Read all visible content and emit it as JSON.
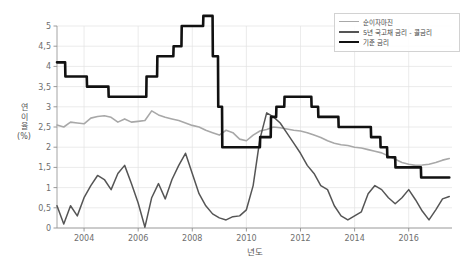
{
  "chart_data": {
    "type": "line",
    "title": "",
    "xlabel": "년도",
    "ylabel": "연이율 (%)",
    "ylabel_chars": [
      "연",
      "이",
      "율",
      "(%)"
    ],
    "xlim": [
      2003.0,
      2017.6
    ],
    "ylim": [
      0,
      5
    ],
    "grid": true,
    "legend_position": "top-right",
    "ytick_labels": [
      "0",
      "0,5",
      "1",
      "1,5",
      "2",
      "2,5",
      "3",
      "3,5",
      "4",
      "4,5",
      "5"
    ],
    "ytick_values": [
      0,
      0.5,
      1,
      1.5,
      2,
      2.5,
      3,
      3.5,
      4,
      4.5,
      5
    ],
    "xtick_labels": [
      "2004",
      "2006",
      "2008",
      "2010",
      "2012",
      "2014",
      "2016"
    ],
    "xtick_values": [
      2004,
      2006,
      2008,
      2010,
      2012,
      2014,
      2016
    ],
    "colors": {
      "nim": "#a8a8a8",
      "spread": "#555555",
      "base_rate": "#111111",
      "grid": "#e3e3e3",
      "axis": "#9a9a9a"
    },
    "series": [
      {
        "name": "순이자마진",
        "key": "nim",
        "color": "#a8a8a8",
        "width": 1.6,
        "x": [
          2003.0,
          2003.25,
          2003.5,
          2003.75,
          2004.0,
          2004.25,
          2004.5,
          2004.75,
          2005.0,
          2005.25,
          2005.5,
          2005.75,
          2006.0,
          2006.25,
          2006.5,
          2006.75,
          2007.0,
          2007.25,
          2007.5,
          2007.75,
          2008.0,
          2008.25,
          2008.5,
          2008.75,
          2009.0,
          2009.25,
          2009.5,
          2009.75,
          2010.0,
          2010.25,
          2010.5,
          2010.75,
          2011.0,
          2011.25,
          2011.5,
          2011.75,
          2012.0,
          2012.25,
          2012.5,
          2012.75,
          2013.0,
          2013.25,
          2013.5,
          2013.75,
          2014.0,
          2014.25,
          2014.5,
          2014.75,
          2015.0,
          2015.25,
          2015.5,
          2015.75,
          2016.0,
          2016.25,
          2016.5,
          2016.75,
          2017.0,
          2017.25,
          2017.5
        ],
        "values": [
          2.55,
          2.5,
          2.62,
          2.6,
          2.58,
          2.72,
          2.76,
          2.78,
          2.74,
          2.62,
          2.7,
          2.62,
          2.64,
          2.66,
          2.9,
          2.8,
          2.74,
          2.7,
          2.66,
          2.6,
          2.54,
          2.5,
          2.42,
          2.36,
          2.3,
          2.42,
          2.36,
          2.2,
          2.16,
          2.3,
          2.4,
          2.44,
          2.5,
          2.48,
          2.45,
          2.42,
          2.4,
          2.36,
          2.3,
          2.24,
          2.16,
          2.1,
          2.06,
          2.04,
          2.0,
          1.98,
          1.94,
          1.9,
          1.86,
          1.78,
          1.7,
          1.62,
          1.58,
          1.55,
          1.56,
          1.58,
          1.62,
          1.68,
          1.72
        ]
      },
      {
        "name": "5년 국고채 금리 - 콜금리",
        "key": "spread",
        "color": "#555555",
        "width": 1.5,
        "x": [
          2003.0,
          2003.25,
          2003.5,
          2003.75,
          2004.0,
          2004.25,
          2004.5,
          2004.75,
          2005.0,
          2005.25,
          2005.5,
          2005.75,
          2006.0,
          2006.25,
          2006.5,
          2006.75,
          2007.0,
          2007.25,
          2007.5,
          2007.75,
          2008.0,
          2008.25,
          2008.5,
          2008.75,
          2009.0,
          2009.25,
          2009.5,
          2009.75,
          2010.0,
          2010.25,
          2010.5,
          2010.75,
          2011.0,
          2011.25,
          2011.5,
          2011.75,
          2012.0,
          2012.25,
          2012.5,
          2012.75,
          2013.0,
          2013.25,
          2013.5,
          2013.75,
          2014.0,
          2014.25,
          2014.5,
          2014.75,
          2015.0,
          2015.25,
          2015.5,
          2015.75,
          2016.0,
          2016.25,
          2016.5,
          2016.75,
          2017.0,
          2017.25,
          2017.5
        ],
        "values": [
          0.55,
          0.1,
          0.55,
          0.3,
          0.75,
          1.05,
          1.3,
          1.2,
          0.95,
          1.35,
          1.55,
          1.1,
          0.62,
          0.02,
          0.75,
          1.1,
          0.72,
          1.2,
          1.55,
          1.85,
          1.35,
          0.85,
          0.55,
          0.35,
          0.25,
          0.2,
          0.28,
          0.3,
          0.45,
          1.05,
          2.2,
          2.85,
          2.75,
          2.6,
          2.35,
          2.1,
          1.85,
          1.55,
          1.35,
          1.05,
          0.95,
          0.55,
          0.3,
          0.2,
          0.3,
          0.4,
          0.85,
          1.05,
          0.95,
          0.75,
          0.6,
          0.75,
          0.95,
          0.7,
          0.42,
          0.2,
          0.45,
          0.72,
          0.78
        ]
      },
      {
        "name": "기준 금리",
        "key": "base_rate",
        "color": "#111111",
        "width": 2.6,
        "x": [
          2003.0,
          2003.3,
          2003.31,
          2004.1,
          2004.11,
          2004.9,
          2004.91,
          2005.9,
          2005.91,
          2006.3,
          2006.31,
          2006.7,
          2006.71,
          2007.3,
          2007.31,
          2007.6,
          2007.61,
          2008.4,
          2008.41,
          2008.75,
          2008.76,
          2008.95,
          2008.96,
          2009.1,
          2009.11,
          2010.5,
          2010.51,
          2010.9,
          2010.91,
          2011.1,
          2011.11,
          2011.4,
          2011.41,
          2012.4,
          2012.41,
          2012.65,
          2012.66,
          2013.4,
          2013.41,
          2014.6,
          2014.61,
          2014.95,
          2014.96,
          2015.2,
          2015.21,
          2015.5,
          2015.51,
          2016.45,
          2016.46,
          2017.5
        ],
        "values": [
          4.1,
          4.1,
          3.75,
          3.75,
          3.5,
          3.5,
          3.25,
          3.25,
          3.25,
          3.25,
          3.75,
          3.75,
          4.25,
          4.25,
          4.5,
          4.5,
          5.0,
          5.0,
          5.25,
          5.25,
          4.25,
          4.25,
          3.0,
          3.0,
          2.0,
          2.0,
          2.25,
          2.25,
          2.75,
          2.75,
          3.0,
          3.0,
          3.25,
          3.25,
          3.0,
          3.0,
          2.75,
          2.75,
          2.5,
          2.5,
          2.25,
          2.25,
          2.0,
          2.0,
          1.75,
          1.75,
          1.5,
          1.5,
          1.25,
          1.25
        ]
      }
    ]
  },
  "legend": {
    "items": [
      {
        "label": "순이자마진",
        "color": "#a8a8a8",
        "thickness": "1.6px"
      },
      {
        "label": "5년 국고채 금리 - 콜금리",
        "color": "#555555",
        "thickness": "2px"
      },
      {
        "label": "기준 금리",
        "color": "#111111",
        "thickness": "2.8px"
      }
    ]
  },
  "axes": {
    "x_title": "년도",
    "y_title": "연이율 (%)"
  }
}
